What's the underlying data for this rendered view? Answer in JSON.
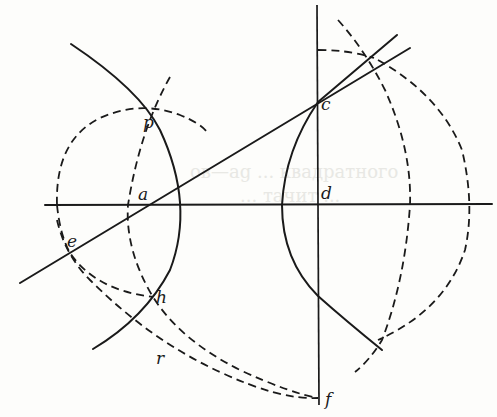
{
  "figure": {
    "colors": {
      "ink": "#1a1a1a",
      "paper": "#fdfdfb",
      "ghost_text": "#e8e8e4"
    },
    "point_labels": {
      "p": "p",
      "a": "a",
      "e": "e",
      "h": "h",
      "r": "r",
      "c": "c",
      "d": "d",
      "f": "f"
    },
    "ghost_text": {
      "line1": "ов—ag ... квадратного",
      "line2": "... тaчит ..."
    }
  }
}
